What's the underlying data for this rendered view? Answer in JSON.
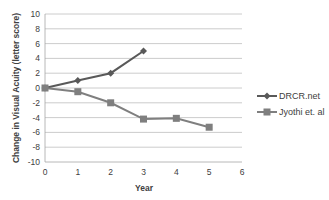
{
  "chart_data": {
    "type": "line",
    "title": "",
    "xlabel": "Year",
    "ylabel": "Change in Visual Acuity (letter score)",
    "xlim": [
      0,
      6
    ],
    "ylim": [
      -10,
      10
    ],
    "x_ticks": [
      0,
      1,
      2,
      3,
      4,
      5,
      6
    ],
    "y_ticks": [
      10,
      8,
      6,
      4,
      2,
      0,
      -2,
      -4,
      -6,
      -8,
      -10
    ],
    "grid": "horizontal",
    "legend_position": "right",
    "series": [
      {
        "name": "DRCR.net",
        "marker": "diamond",
        "color": "#595959",
        "x": [
          0,
          1,
          2,
          3
        ],
        "values": [
          0,
          1,
          2,
          5
        ]
      },
      {
        "name": "Jyothi et. al",
        "marker": "square",
        "color": "#7f7f7f",
        "x": [
          0,
          1,
          2,
          3,
          4,
          5
        ],
        "values": [
          0,
          -0.5,
          -2,
          -4.2,
          -4.1,
          -5.3
        ]
      }
    ]
  },
  "labels": {
    "xlabel": "Year",
    "ylabel": "Change in Visual Acuity (letter score)",
    "legend": [
      "DRCR.net",
      "Jyothi et. al"
    ]
  }
}
